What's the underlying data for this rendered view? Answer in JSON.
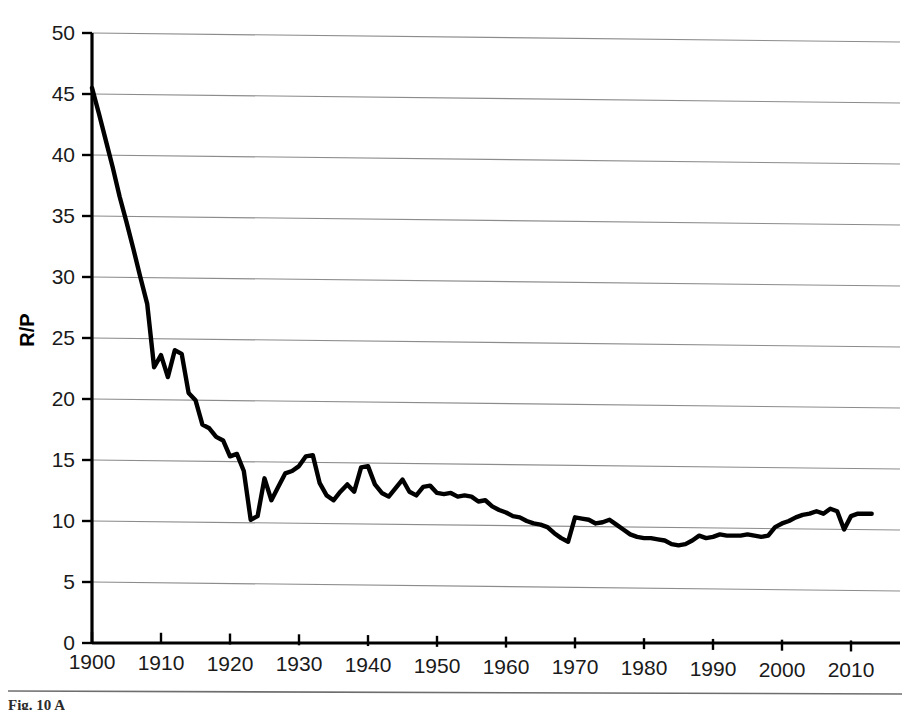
{
  "figure": {
    "caption_partial": "Fig. 10  A"
  },
  "chart_data": {
    "type": "line",
    "title": "",
    "xlabel": "",
    "ylabel": "R/P",
    "xlim": [
      1900,
      2013
    ],
    "ylim": [
      0,
      50
    ],
    "ytick_step": 5,
    "xtick_step": 10,
    "grid": true,
    "legend": null,
    "yticks": [
      0,
      5,
      10,
      15,
      20,
      25,
      30,
      35,
      40,
      45,
      50
    ],
    "ytick_labels": [
      "0",
      "5",
      "10",
      "15",
      "20",
      "25",
      "30",
      "35",
      "40",
      "45",
      "50"
    ],
    "xticks": [
      1900,
      1910,
      1920,
      1930,
      1940,
      1950,
      1960,
      1970,
      1980,
      1990,
      2000,
      2010
    ],
    "xtick_labels": [
      "1900",
      "1910",
      "1920",
      "1930",
      "1940",
      "1950",
      "1960",
      "1970",
      "1980",
      "1990",
      "2000",
      "2010"
    ],
    "line_color": "#000000",
    "grid_color": "#8c8c8c",
    "series": [
      {
        "name": "R/P",
        "x": [
          1900,
          1901,
          1902,
          1903,
          1904,
          1905,
          1906,
          1907,
          1908,
          1909,
          1910,
          1911,
          1912,
          1913,
          1914,
          1915,
          1916,
          1917,
          1918,
          1919,
          1920,
          1921,
          1922,
          1923,
          1924,
          1925,
          1926,
          1927,
          1928,
          1929,
          1930,
          1931,
          1932,
          1933,
          1934,
          1935,
          1936,
          1937,
          1938,
          1939,
          1940,
          1941,
          1942,
          1943,
          1944,
          1945,
          1946,
          1947,
          1948,
          1949,
          1950,
          1951,
          1952,
          1953,
          1954,
          1955,
          1956,
          1957,
          1958,
          1959,
          1960,
          1961,
          1962,
          1963,
          1964,
          1965,
          1966,
          1967,
          1968,
          1969,
          1970,
          1971,
          1972,
          1973,
          1974,
          1975,
          1976,
          1977,
          1978,
          1979,
          1980,
          1981,
          1982,
          1983,
          1984,
          1985,
          1986,
          1987,
          1988,
          1989,
          1990,
          1991,
          1992,
          1993,
          1994,
          1995,
          1996,
          1997,
          1998,
          1999,
          2000,
          2001,
          2002,
          2003,
          2004,
          2005,
          2006,
          2007,
          2008,
          2009,
          2010,
          2011,
          2012,
          2013
        ],
        "values": [
          45.5,
          43.4,
          41.2,
          39.0,
          36.6,
          34.5,
          32.3,
          30.0,
          27.8,
          22.6,
          23.6,
          21.8,
          24.0,
          23.7,
          20.5,
          19.9,
          17.9,
          17.6,
          16.9,
          16.6,
          15.3,
          15.5,
          14.1,
          10.1,
          10.4,
          13.5,
          11.7,
          12.8,
          13.9,
          14.1,
          14.5,
          15.3,
          15.4,
          13.1,
          12.1,
          11.7,
          12.4,
          13.0,
          12.4,
          14.4,
          14.5,
          13.0,
          12.3,
          12.0,
          12.7,
          13.4,
          12.4,
          12.1,
          12.8,
          12.9,
          12.3,
          12.2,
          12.3,
          12.0,
          12.1,
          12.0,
          11.6,
          11.7,
          11.2,
          10.9,
          10.7,
          10.4,
          10.3,
          10.0,
          9.8,
          9.7,
          9.5,
          9.0,
          8.6,
          8.3,
          10.3,
          10.2,
          10.1,
          9.8,
          9.9,
          10.1,
          9.7,
          9.3,
          8.9,
          8.7,
          8.6,
          8.6,
          8.5,
          8.4,
          8.1,
          8.0,
          8.1,
          8.4,
          8.8,
          8.6,
          8.7,
          8.9,
          8.8,
          8.8,
          8.8,
          8.9,
          8.8,
          8.7,
          8.8,
          9.5,
          9.8,
          10.0,
          10.3,
          10.5,
          10.6,
          10.8,
          10.6,
          11.0,
          10.8,
          9.3,
          10.4,
          10.6,
          10.6,
          10.6
        ]
      }
    ]
  }
}
